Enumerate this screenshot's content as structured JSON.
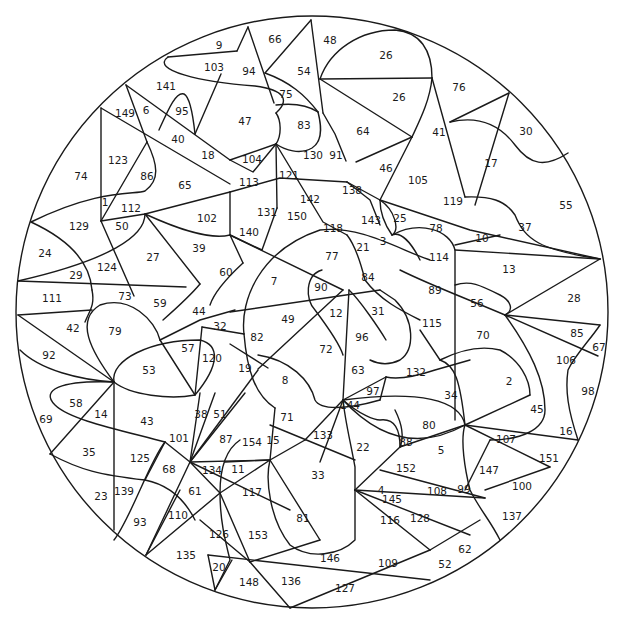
{
  "page": {
    "width": 625,
    "height": 618
  },
  "colors": {
    "background": "#ffffff",
    "stroke": "#1a1a1a",
    "text": "#1a1a1a"
  },
  "circle": {
    "cx": 312,
    "cy": 312,
    "r": 296
  },
  "labels": [
    {
      "n": "9",
      "x": 219,
      "y": 45
    },
    {
      "n": "66",
      "x": 275,
      "y": 39
    },
    {
      "n": "48",
      "x": 330,
      "y": 40
    },
    {
      "n": "103",
      "x": 214,
      "y": 67
    },
    {
      "n": "94",
      "x": 249,
      "y": 71
    },
    {
      "n": "54",
      "x": 304,
      "y": 71
    },
    {
      "n": "26",
      "x": 386,
      "y": 55
    },
    {
      "n": "141",
      "x": 166,
      "y": 86
    },
    {
      "n": "75",
      "x": 286,
      "y": 94
    },
    {
      "n": "26",
      "x": 399,
      "y": 97
    },
    {
      "n": "76",
      "x": 459,
      "y": 87
    },
    {
      "n": "149",
      "x": 125,
      "y": 113
    },
    {
      "n": "6",
      "x": 146,
      "y": 110
    },
    {
      "n": "95",
      "x": 182,
      "y": 111
    },
    {
      "n": "47",
      "x": 245,
      "y": 121
    },
    {
      "n": "83",
      "x": 304,
      "y": 125
    },
    {
      "n": "64",
      "x": 363,
      "y": 131
    },
    {
      "n": "41",
      "x": 439,
      "y": 132
    },
    {
      "n": "30",
      "x": 526,
      "y": 131
    },
    {
      "n": "40",
      "x": 178,
      "y": 139
    },
    {
      "n": "18",
      "x": 208,
      "y": 155
    },
    {
      "n": "104",
      "x": 252,
      "y": 159
    },
    {
      "n": "130",
      "x": 313,
      "y": 155
    },
    {
      "n": "91",
      "x": 336,
      "y": 155
    },
    {
      "n": "123",
      "x": 118,
      "y": 160
    },
    {
      "n": "86",
      "x": 147,
      "y": 176
    },
    {
      "n": "17",
      "x": 491,
      "y": 163
    },
    {
      "n": "74",
      "x": 81,
      "y": 176
    },
    {
      "n": "65",
      "x": 185,
      "y": 185
    },
    {
      "n": "113",
      "x": 249,
      "y": 182
    },
    {
      "n": "121",
      "x": 289,
      "y": 175
    },
    {
      "n": "46",
      "x": 386,
      "y": 168
    },
    {
      "n": "105",
      "x": 418,
      "y": 180
    },
    {
      "n": "138",
      "x": 352,
      "y": 190
    },
    {
      "n": "142",
      "x": 310,
      "y": 199
    },
    {
      "n": "119",
      "x": 453,
      "y": 201
    },
    {
      "n": "55",
      "x": 566,
      "y": 205
    },
    {
      "n": "1",
      "x": 105,
      "y": 202
    },
    {
      "n": "112",
      "x": 131,
      "y": 208
    },
    {
      "n": "102",
      "x": 207,
      "y": 218
    },
    {
      "n": "131",
      "x": 267,
      "y": 212
    },
    {
      "n": "150",
      "x": 297,
      "y": 216
    },
    {
      "n": "143",
      "x": 371,
      "y": 220
    },
    {
      "n": "25",
      "x": 400,
      "y": 218
    },
    {
      "n": "118",
      "x": 333,
      "y": 228
    },
    {
      "n": "78",
      "x": 436,
      "y": 228
    },
    {
      "n": "10",
      "x": 482,
      "y": 238
    },
    {
      "n": "37",
      "x": 525,
      "y": 227
    },
    {
      "n": "129",
      "x": 79,
      "y": 226
    },
    {
      "n": "50",
      "x": 122,
      "y": 226
    },
    {
      "n": "24",
      "x": 45,
      "y": 253
    },
    {
      "n": "140",
      "x": 249,
      "y": 232
    },
    {
      "n": "39",
      "x": 199,
      "y": 248
    },
    {
      "n": "21",
      "x": 363,
      "y": 247
    },
    {
      "n": "3",
      "x": 383,
      "y": 241
    },
    {
      "n": "114",
      "x": 439,
      "y": 257
    },
    {
      "n": "27",
      "x": 153,
      "y": 257
    },
    {
      "n": "77",
      "x": 332,
      "y": 256
    },
    {
      "n": "13",
      "x": 509,
      "y": 269
    },
    {
      "n": "124",
      "x": 107,
      "y": 267
    },
    {
      "n": "60",
      "x": 226,
      "y": 272
    },
    {
      "n": "84",
      "x": 368,
      "y": 277
    },
    {
      "n": "29",
      "x": 76,
      "y": 275
    },
    {
      "n": "7",
      "x": 274,
      "y": 281
    },
    {
      "n": "90",
      "x": 321,
      "y": 287
    },
    {
      "n": "89",
      "x": 435,
      "y": 290
    },
    {
      "n": "111",
      "x": 52,
      "y": 298
    },
    {
      "n": "73",
      "x": 125,
      "y": 296
    },
    {
      "n": "59",
      "x": 160,
      "y": 303
    },
    {
      "n": "56",
      "x": 477,
      "y": 303
    },
    {
      "n": "28",
      "x": 574,
      "y": 298
    },
    {
      "n": "44",
      "x": 199,
      "y": 311
    },
    {
      "n": "12",
      "x": 336,
      "y": 313
    },
    {
      "n": "31",
      "x": 378,
      "y": 311
    },
    {
      "n": "49",
      "x": 288,
      "y": 319
    },
    {
      "n": "32",
      "x": 220,
      "y": 326
    },
    {
      "n": "115",
      "x": 432,
      "y": 323
    },
    {
      "n": "42",
      "x": 73,
      "y": 328
    },
    {
      "n": "79",
      "x": 115,
      "y": 331
    },
    {
      "n": "82",
      "x": 257,
      "y": 337
    },
    {
      "n": "70",
      "x": 483,
      "y": 335
    },
    {
      "n": "85",
      "x": 577,
      "y": 333
    },
    {
      "n": "96",
      "x": 362,
      "y": 337
    },
    {
      "n": "57",
      "x": 188,
      "y": 348
    },
    {
      "n": "72",
      "x": 326,
      "y": 349
    },
    {
      "n": "120",
      "x": 212,
      "y": 358
    },
    {
      "n": "92",
      "x": 49,
      "y": 355
    },
    {
      "n": "67",
      "x": 599,
      "y": 347
    },
    {
      "n": "106",
      "x": 566,
      "y": 360
    },
    {
      "n": "19",
      "x": 245,
      "y": 368
    },
    {
      "n": "53",
      "x": 149,
      "y": 370
    },
    {
      "n": "63",
      "x": 358,
      "y": 370
    },
    {
      "n": "132",
      "x": 416,
      "y": 372
    },
    {
      "n": "8",
      "x": 285,
      "y": 380
    },
    {
      "n": "2",
      "x": 509,
      "y": 381
    },
    {
      "n": "98",
      "x": 588,
      "y": 391
    },
    {
      "n": "97",
      "x": 373,
      "y": 391
    },
    {
      "n": "34",
      "x": 451,
      "y": 395
    },
    {
      "n": "58",
      "x": 76,
      "y": 403
    },
    {
      "n": "144",
      "x": 350,
      "y": 405
    },
    {
      "n": "45",
      "x": 537,
      "y": 409
    },
    {
      "n": "14",
      "x": 101,
      "y": 414
    },
    {
      "n": "69",
      "x": 46,
      "y": 419
    },
    {
      "n": "43",
      "x": 147,
      "y": 421
    },
    {
      "n": "38",
      "x": 201,
      "y": 414
    },
    {
      "n": "51",
      "x": 220,
      "y": 414
    },
    {
      "n": "71",
      "x": 287,
      "y": 417
    },
    {
      "n": "80",
      "x": 429,
      "y": 425
    },
    {
      "n": "16",
      "x": 566,
      "y": 431
    },
    {
      "n": "133",
      "x": 323,
      "y": 435
    },
    {
      "n": "101",
      "x": 179,
      "y": 438
    },
    {
      "n": "87",
      "x": 226,
      "y": 439
    },
    {
      "n": "154",
      "x": 252,
      "y": 442
    },
    {
      "n": "15",
      "x": 273,
      "y": 440
    },
    {
      "n": "88",
      "x": 406,
      "y": 442
    },
    {
      "n": "107",
      "x": 506,
      "y": 439
    },
    {
      "n": "22",
      "x": 363,
      "y": 447
    },
    {
      "n": "5",
      "x": 441,
      "y": 450
    },
    {
      "n": "35",
      "x": 89,
      "y": 452
    },
    {
      "n": "125",
      "x": 140,
      "y": 458
    },
    {
      "n": "151",
      "x": 549,
      "y": 458
    },
    {
      "n": "68",
      "x": 169,
      "y": 469
    },
    {
      "n": "134",
      "x": 212,
      "y": 470
    },
    {
      "n": "11",
      "x": 238,
      "y": 469
    },
    {
      "n": "152",
      "x": 406,
      "y": 468
    },
    {
      "n": "33",
      "x": 318,
      "y": 475
    },
    {
      "n": "147",
      "x": 489,
      "y": 470
    },
    {
      "n": "139",
      "x": 124,
      "y": 491
    },
    {
      "n": "23",
      "x": 101,
      "y": 496
    },
    {
      "n": "61",
      "x": 195,
      "y": 491
    },
    {
      "n": "117",
      "x": 252,
      "y": 492
    },
    {
      "n": "145",
      "x": 392,
      "y": 499
    },
    {
      "n": "4",
      "x": 381,
      "y": 490
    },
    {
      "n": "108",
      "x": 437,
      "y": 491
    },
    {
      "n": "99",
      "x": 464,
      "y": 489
    },
    {
      "n": "100",
      "x": 522,
      "y": 486
    },
    {
      "n": "110",
      "x": 178,
      "y": 515
    },
    {
      "n": "81",
      "x": 303,
      "y": 518
    },
    {
      "n": "93",
      "x": 140,
      "y": 522
    },
    {
      "n": "116",
      "x": 390,
      "y": 520
    },
    {
      "n": "128",
      "x": 420,
      "y": 518
    },
    {
      "n": "137",
      "x": 512,
      "y": 516
    },
    {
      "n": "126",
      "x": 219,
      "y": 534
    },
    {
      "n": "153",
      "x": 258,
      "y": 535
    },
    {
      "n": "135",
      "x": 186,
      "y": 555
    },
    {
      "n": "146",
      "x": 330,
      "y": 558
    },
    {
      "n": "62",
      "x": 465,
      "y": 549
    },
    {
      "n": "109",
      "x": 388,
      "y": 563
    },
    {
      "n": "52",
      "x": 445,
      "y": 564
    },
    {
      "n": "20",
      "x": 219,
      "y": 567
    },
    {
      "n": "148",
      "x": 249,
      "y": 582
    },
    {
      "n": "136",
      "x": 291,
      "y": 581
    },
    {
      "n": "127",
      "x": 345,
      "y": 588
    }
  ]
}
